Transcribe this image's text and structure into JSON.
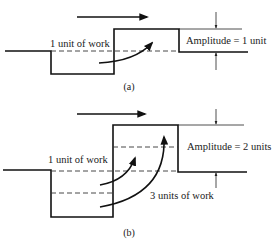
{
  "figure": {
    "panel_a": {
      "caption": "(a)",
      "work_label": "1 unit of work",
      "amplitude_label": "Amplitude = 1 unit",
      "direction": "right-arrow"
    },
    "panel_b": {
      "caption": "(b)",
      "work_label_small": "1 unit of work",
      "work_label_large": "3 units of work",
      "amplitude_label": "Amplitude = 2 units",
      "direction": "right-arrow"
    }
  }
}
